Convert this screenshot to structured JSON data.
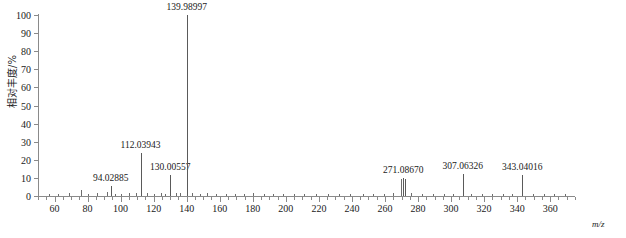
{
  "chart_data": {
    "type": "bar",
    "title": "",
    "xlabel": "m/z",
    "ylabel": "相对丰度/%",
    "xlim": [
      50,
      375
    ],
    "ylim": [
      0,
      100
    ],
    "grid": false,
    "legend": null,
    "x_ticks": [
      60,
      80,
      100,
      120,
      140,
      160,
      180,
      200,
      220,
      240,
      260,
      280,
      300,
      320,
      340,
      360
    ],
    "x_minor_step": 5,
    "y_ticks": [
      0,
      10,
      20,
      30,
      40,
      50,
      60,
      70,
      80,
      90,
      100
    ],
    "labeled_peaks": [
      {
        "mz": "94.02885",
        "x": 94.02885,
        "value": 5.5
      },
      {
        "mz": "112.03943",
        "x": 112.03943,
        "value": 24.0
      },
      {
        "mz": "130.00557",
        "x": 130.00557,
        "value": 11.5
      },
      {
        "mz": "139.98997",
        "x": 139.98997,
        "value": 100.0
      },
      {
        "mz": "271.08670",
        "x": 271.0867,
        "value": 10.0
      },
      {
        "mz": "307.06326",
        "x": 307.06326,
        "value": 12.0
      },
      {
        "mz": "343.04016",
        "x": 343.04016,
        "value": 11.5
      }
    ],
    "minor_peaks": [
      {
        "x": 56.5,
        "value": 1.2
      },
      {
        "x": 62.0,
        "value": 1.0
      },
      {
        "x": 68.5,
        "value": 1.4
      },
      {
        "x": 76.0,
        "value": 3.2
      },
      {
        "x": 80.5,
        "value": 1.2
      },
      {
        "x": 86.0,
        "value": 1.6
      },
      {
        "x": 92.0,
        "value": 2.0
      },
      {
        "x": 96.5,
        "value": 1.3
      },
      {
        "x": 100.5,
        "value": 1.1
      },
      {
        "x": 105.0,
        "value": 1.5
      },
      {
        "x": 109.5,
        "value": 1.8
      },
      {
        "x": 116.0,
        "value": 1.4
      },
      {
        "x": 120.5,
        "value": 1.2
      },
      {
        "x": 124.5,
        "value": 1.6
      },
      {
        "x": 127.0,
        "value": 1.3
      },
      {
        "x": 133.5,
        "value": 1.5
      },
      {
        "x": 136.0,
        "value": 1.9
      },
      {
        "x": 143.5,
        "value": 1.4
      },
      {
        "x": 148.0,
        "value": 1.1
      },
      {
        "x": 152.5,
        "value": 1.7
      },
      {
        "x": 158.0,
        "value": 1.2
      },
      {
        "x": 163.5,
        "value": 1.0
      },
      {
        "x": 169.0,
        "value": 1.3
      },
      {
        "x": 174.5,
        "value": 1.1
      },
      {
        "x": 180.0,
        "value": 1.4
      },
      {
        "x": 186.5,
        "value": 1.0
      },
      {
        "x": 192.0,
        "value": 1.2
      },
      {
        "x": 198.5,
        "value": 1.1
      },
      {
        "x": 205.0,
        "value": 1.3
      },
      {
        "x": 211.0,
        "value": 1.0
      },
      {
        "x": 218.0,
        "value": 1.2
      },
      {
        "x": 225.5,
        "value": 1.1
      },
      {
        "x": 232.0,
        "value": 1.3
      },
      {
        "x": 239.0,
        "value": 1.0
      },
      {
        "x": 246.5,
        "value": 1.2
      },
      {
        "x": 253.0,
        "value": 1.1
      },
      {
        "x": 259.5,
        "value": 1.3
      },
      {
        "x": 265.0,
        "value": 1.5
      },
      {
        "x": 269.5,
        "value": 9.2
      },
      {
        "x": 276.0,
        "value": 1.4
      },
      {
        "x": 282.5,
        "value": 1.1
      },
      {
        "x": 289.0,
        "value": 1.2
      },
      {
        "x": 295.5,
        "value": 1.0
      },
      {
        "x": 301.0,
        "value": 1.3
      },
      {
        "x": 312.0,
        "value": 1.2
      },
      {
        "x": 318.5,
        "value": 1.0
      },
      {
        "x": 325.0,
        "value": 1.1
      },
      {
        "x": 331.5,
        "value": 1.0
      },
      {
        "x": 337.0,
        "value": 1.2
      },
      {
        "x": 349.5,
        "value": 1.1
      },
      {
        "x": 356.0,
        "value": 1.0
      },
      {
        "x": 362.5,
        "value": 1.0
      },
      {
        "x": 369.0,
        "value": 1.1
      }
    ]
  }
}
